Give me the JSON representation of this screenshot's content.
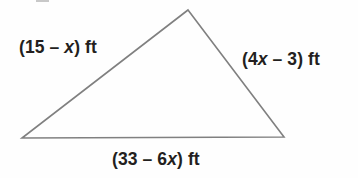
{
  "figure": {
    "type": "geometry-diagram",
    "shape": "triangle",
    "background_color": "#fefefe",
    "stroke_color": "#808080",
    "stroke_width": 1.6,
    "text_color": "#231f20",
    "vertices": [
      {
        "name": "apex",
        "x": 188,
        "y": 10
      },
      {
        "name": "bottom-right",
        "x": 284,
        "y": 137
      },
      {
        "name": "bottom-left",
        "x": 22,
        "y": 138
      }
    ],
    "labels": {
      "left": {
        "parts": [
          {
            "text": "(15 – ",
            "italic": false
          },
          {
            "text": "x",
            "italic": true
          },
          {
            "text": ") ft",
            "italic": false
          }
        ],
        "plain": "(15 – x) ft"
      },
      "right": {
        "parts": [
          {
            "text": "(4",
            "italic": false
          },
          {
            "text": "x",
            "italic": true
          },
          {
            "text": " – 3) ft",
            "italic": false
          }
        ],
        "plain": "(4x – 3) ft"
      },
      "bottom": {
        "parts": [
          {
            "text": "(33 – 6",
            "italic": false
          },
          {
            "text": "x",
            "italic": true
          },
          {
            "text": ") ft",
            "italic": false
          }
        ],
        "plain": "(33 – 6x) ft"
      }
    }
  }
}
